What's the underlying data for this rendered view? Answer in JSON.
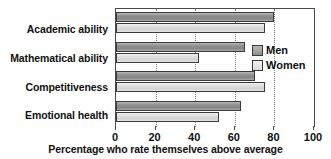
{
  "chart_data": {
    "type": "bar",
    "orientation": "horizontal",
    "title": "",
    "xlabel": "Percentage who rate themselves above average",
    "ylabel": "",
    "categories": [
      "Academic ability",
      "Mathematical ability",
      "Competitiveness",
      "Emotional health"
    ],
    "series": [
      {
        "name": "Men",
        "values": [
          80,
          65,
          70,
          63
        ]
      },
      {
        "name": "Women",
        "values": [
          75,
          42,
          75,
          52
        ]
      }
    ],
    "xlim": [
      0,
      100
    ],
    "xticks": [
      0,
      20,
      40,
      60,
      80,
      100
    ],
    "xtick_labels": [
      "0",
      "20",
      "40",
      "60",
      "80",
      "100"
    ],
    "grid": "vertical-dotted",
    "legend_position": "inside-right",
    "colors": {
      "men": "#8f8f8f",
      "women": "#dcdcdc",
      "bar_outline": "#3b3b3b",
      "axis": "#4a4a4a",
      "gridline": "#7a7a7a",
      "text": "#111111",
      "background": "#ffffff"
    }
  },
  "legend": {
    "items": [
      {
        "label": "Men"
      },
      {
        "label": "Women"
      }
    ]
  }
}
